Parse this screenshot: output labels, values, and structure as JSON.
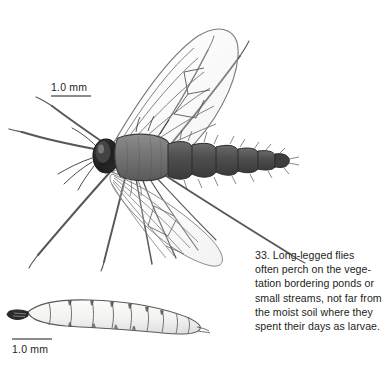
{
  "plate": {
    "name": "long-legged-fly-plate",
    "background_color": "#ffffff",
    "ink_color": "#231f20"
  },
  "scale_bars": {
    "adult": {
      "label": "1.0 mm",
      "rule_color": "#8c8c8c"
    },
    "larva": {
      "label": "1.0 mm",
      "rule_color": "#8c8c8c"
    }
  },
  "caption": {
    "number": "33.",
    "lines": [
      "33. Long-legged flies",
      "often perch on the vege-",
      "tation bordering ponds or",
      "small streams, not far from",
      "the moist soil where they",
      "spent their days as larvae."
    ],
    "full_text": "33. Long-legged flies often perch on the vegetation bordering ponds or small streams, not far from the moist soil where they spent their days as larvae."
  },
  "figures": {
    "adult": {
      "name": "adult-long-legged-fly",
      "parts": [
        "head",
        "eye",
        "antenna",
        "thorax",
        "abdomen",
        "wing-upper",
        "wing-lower",
        "legs",
        "halteres"
      ],
      "body_color": "#6f6f6f",
      "head_color": "#2b2b2b",
      "abdomen_band_color": "#4a4a4a"
    },
    "larva": {
      "name": "fly-larva",
      "parts": [
        "head-capsule",
        "body-segments",
        "tail"
      ],
      "body_color": "#f4f4f2",
      "outline_color": "#555555",
      "segment_count": 11
    }
  }
}
